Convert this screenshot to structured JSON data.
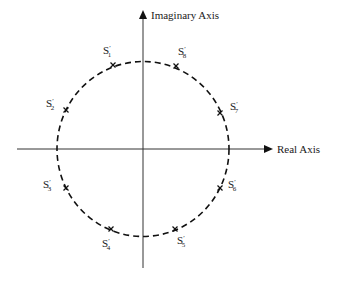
{
  "diagram": {
    "axes": {
      "imaginary_label": "Imaginary Axis",
      "real_label": "Real Axis"
    },
    "circle": {
      "style": "dashed",
      "cx": 143,
      "cy": 149,
      "r": 86
    },
    "points": [
      {
        "name": "S",
        "sub": "1",
        "x": 113,
        "y": 65,
        "lx": 103,
        "ly": 54
      },
      {
        "name": "S",
        "sub": "8",
        "x": 176,
        "y": 66,
        "lx": 178,
        "ly": 55
      },
      {
        "name": "S",
        "sub": "2",
        "x": 66,
        "y": 110,
        "lx": 46,
        "ly": 107
      },
      {
        "name": "S",
        "sub": "7",
        "x": 220,
        "y": 113,
        "lx": 230,
        "ly": 110
      },
      {
        "name": "S",
        "sub": "3",
        "x": 66,
        "y": 188,
        "lx": 43,
        "ly": 188
      },
      {
        "name": "S",
        "sub": "6",
        "x": 220,
        "y": 188,
        "lx": 228,
        "ly": 188
      },
      {
        "name": "S",
        "sub": "4",
        "x": 111,
        "y": 229,
        "lx": 102,
        "ly": 247
      },
      {
        "name": "S",
        "sub": "5",
        "x": 175,
        "y": 229,
        "lx": 177,
        "ly": 244
      }
    ],
    "colors": {
      "line": "#1a1a1a",
      "axis": "#333333"
    }
  }
}
